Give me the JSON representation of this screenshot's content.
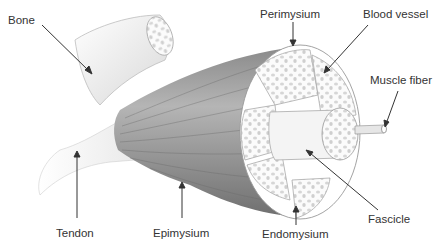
{
  "diagram": {
    "type": "anatomical illustration",
    "labels": [
      {
        "id": "bone",
        "text": "Bone"
      },
      {
        "id": "perimysium",
        "text": "Perimysium"
      },
      {
        "id": "blood-vessel",
        "text": "Blood vessel"
      },
      {
        "id": "muscle-fiber",
        "text": "Muscle fiber"
      },
      {
        "id": "tendon",
        "text": "Tendon"
      },
      {
        "id": "epimysium",
        "text": "Epimysium"
      },
      {
        "id": "endomysium",
        "text": "Endomysium"
      },
      {
        "id": "fascicle",
        "text": "Fascicle"
      }
    ]
  }
}
